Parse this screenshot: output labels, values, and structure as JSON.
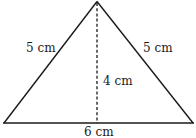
{
  "diagram": {
    "type": "isosceles-triangle",
    "stroke_color": "#1a1a1a",
    "background": "#ffffff",
    "labels": {
      "left_side": "5 cm",
      "right_side": "5 cm",
      "height": "4 cm",
      "base": "6 cm"
    },
    "measurements": {
      "left_side": 5,
      "right_side": 5,
      "height": 4,
      "base": 6,
      "unit": "cm"
    }
  }
}
